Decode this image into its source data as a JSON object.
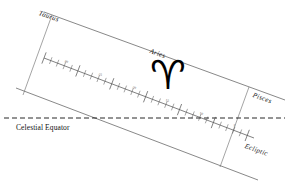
{
  "diagram": {
    "background_color": "#ffffff",
    "line_color": "#555555",
    "text_color": "#111111",
    "labels": {
      "taurus": "Taurus",
      "aries": "Aries",
      "pisces": "Pisces",
      "ecliptic": "Ecliptic",
      "celestial_equator": "Celestial Equator"
    },
    "symbols": {
      "aries_glyph": "♈",
      "aries_glyph_name": "aries-zodiac-symbol"
    },
    "scale": {
      "name": "ecliptic-degree-scale",
      "unit": "degrees",
      "tick_labels": [
        "30",
        "25",
        "20",
        "15",
        "10",
        "5"
      ],
      "major_interval": 5,
      "minor_interval": 1
    },
    "boundaries": [
      {
        "name": "taurus-aries-boundary"
      },
      {
        "name": "aries-pisces-boundary"
      }
    ]
  },
  "chart_data": {
    "type": "line",
    "xlabel": "Ecliptic longitude (degrees)",
    "ylabel": "",
    "categories": [
      "30",
      "25",
      "20",
      "15",
      "10",
      "5"
    ],
    "values": [
      30,
      25,
      20,
      15,
      10,
      5
    ],
    "series": [
      {
        "name": "Ecliptic",
        "values": [
          30,
          25,
          20,
          15,
          10,
          5
        ]
      },
      {
        "name": "Celestial Equator",
        "values": [
          0,
          0,
          0,
          0,
          0,
          0
        ]
      }
    ],
    "legend": [
      "Taurus",
      "Aries",
      "Pisces",
      "Ecliptic",
      "Celestial Equator"
    ],
    "annotations": [
      "Taurus",
      "Aries",
      "Pisces",
      "Ecliptic",
      "Celestial Equator"
    ],
    "grid": false
  }
}
